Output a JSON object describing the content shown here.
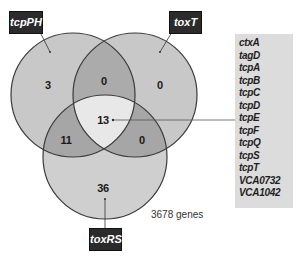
{
  "diagram": {
    "type": "venn-3",
    "sets": [
      {
        "id": "tcpPH",
        "label": "tcpPH"
      },
      {
        "id": "toxT",
        "label": "toxT"
      },
      {
        "id": "toxRS",
        "label": "toxRS"
      }
    ],
    "regions": {
      "tcpPH_only": "3",
      "toxT_only": "0",
      "toxRS_only": "36",
      "tcpPH_toxT": "0",
      "tcpPH_toxRS": "11",
      "toxT_toxRS": "0",
      "all_three": "13"
    },
    "total_label": "3678 genes",
    "gene_list": {
      "region": "all_three",
      "genes": [
        "ctxA",
        "tagD",
        "tcpA",
        "tcpB",
        "tcpC",
        "tcpD",
        "tcpE",
        "tcpF",
        "tcpQ",
        "tcpS",
        "tcpT",
        "VCA0732",
        "VCA1042"
      ]
    },
    "colors": {
      "single": "#c8c8c8",
      "double": "#a8a8a8",
      "triple": "#e6e6e6",
      "outline": "#3a3a3a",
      "label_bg": "#2b2b2b",
      "gene_box_bg": "#dcdcdc"
    }
  }
}
